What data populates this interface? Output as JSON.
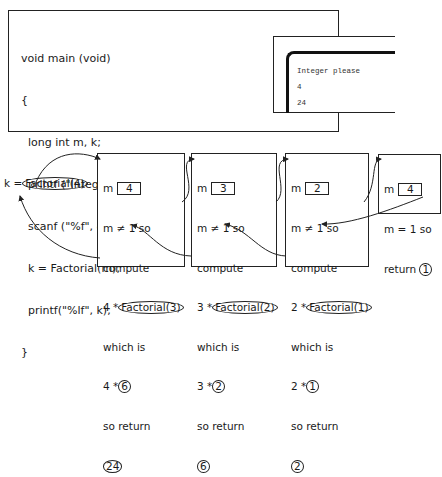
{
  "code": {
    "lines": [
      "void main (void)",
      "{",
      "  long int m, k;",
      "  printf (\"Integer please\\n\");",
      "  scanf (\"%f\", &m );",
      "  k = Factorial(m);",
      "  printf(\"%lf\", k);",
      "}"
    ]
  },
  "screen": {
    "lines": [
      "Integer please",
      "4",
      "24"
    ]
  },
  "call": {
    "prefix": "k =",
    "expr": "Factorial(4)"
  },
  "frames": [
    {
      "m_label": "m",
      "m_value": "4",
      "cond": "m ≠ 1 so",
      "compute": "compute",
      "expr_prefix": "4 *",
      "expr_call": "Factorial(3)",
      "which": "which is",
      "result_prefix": "4 *",
      "result_value": "6",
      "so_return": "so return",
      "return_value": "24"
    },
    {
      "m_label": "m",
      "m_value": "3",
      "cond": "m ≠ 1 so",
      "compute": "compute",
      "expr_prefix": "3 *",
      "expr_call": "Factorial(2)",
      "which": "which is",
      "result_prefix": "3 *",
      "result_value": "2",
      "so_return": "so return",
      "return_value": "6"
    },
    {
      "m_label": "m",
      "m_value": "2",
      "cond": "m ≠ 1 so",
      "compute": "compute",
      "expr_prefix": "2 *",
      "expr_call": "Factorial(1)",
      "which": "which is",
      "result_prefix": "2 *",
      "result_value": "1",
      "so_return": "so return",
      "return_value": "2"
    },
    {
      "m_label": "m",
      "m_value": "4",
      "cond": "m = 1 so",
      "return_label": "return",
      "return_value": "1"
    }
  ]
}
